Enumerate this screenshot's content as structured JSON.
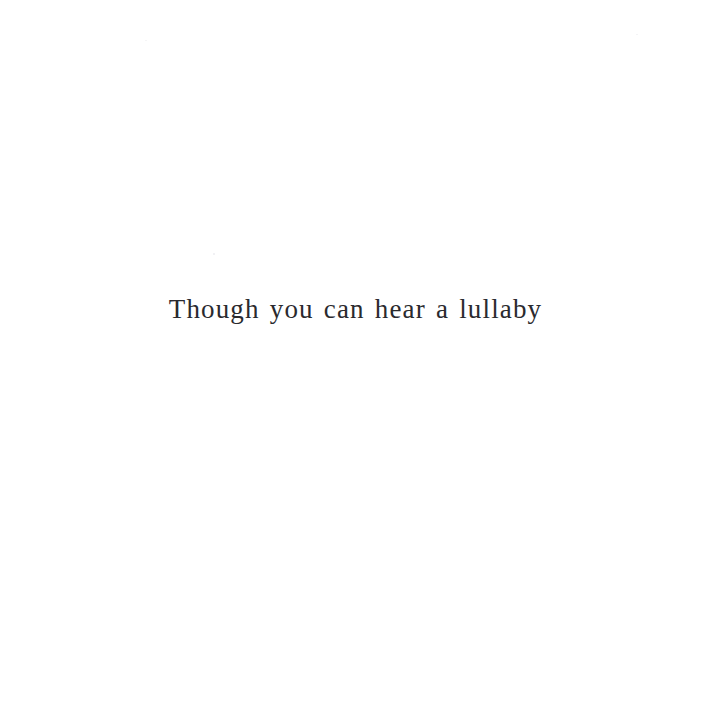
{
  "page": {
    "background_color": "#ffffff",
    "text_color": "#2a2a2e",
    "width": 711,
    "height": 716
  },
  "content": {
    "verse_line": "Though you can hear a lullaby"
  }
}
